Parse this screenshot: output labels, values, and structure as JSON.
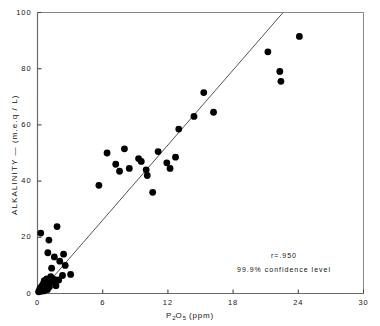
{
  "chart_data": {
    "type": "scatter",
    "title": "",
    "xlabel": "P2O5 (ppm)",
    "xlabel_parts": {
      "pre": "P",
      "sub1": "2",
      "mid": "O",
      "sub2": "5",
      "post": " (ppm)"
    },
    "ylabel": "ALKALINITY — (m.e.q / L)",
    "xlim": [
      0,
      30
    ],
    "ylim": [
      0,
      100
    ],
    "xticks": [
      0,
      6,
      12,
      18,
      24,
      30
    ],
    "xticklabels": [
      "0",
      "6",
      "12",
      "18",
      "24",
      "30"
    ],
    "yticks": [
      0,
      20,
      40,
      60,
      80,
      100
    ],
    "yticklabels": [
      "0",
      "20",
      "40",
      "60",
      "80",
      "100"
    ],
    "grid": false,
    "legend": "none",
    "marker": "filled-circle",
    "marker_color": "#000000",
    "line_color": "#555555",
    "frame_color": "#888888",
    "annotations": [
      {
        "name": "correlation",
        "text": "r=.950"
      },
      {
        "name": "confidence",
        "text": "99.9% confidence level"
      }
    ],
    "fit_line": {
      "name": "regression-line",
      "x": [
        0.35,
        22.6
      ],
      "y": [
        1.0,
        100.0
      ]
    },
    "points": [
      {
        "x": 0.1,
        "y": 0.6
      },
      {
        "x": 0.18,
        "y": 1.2
      },
      {
        "x": 0.25,
        "y": 2.0
      },
      {
        "x": 0.32,
        "y": 0.8
      },
      {
        "x": 0.4,
        "y": 2.6
      },
      {
        "x": 0.45,
        "y": 1.6
      },
      {
        "x": 0.52,
        "y": 3.4
      },
      {
        "x": 0.58,
        "y": 0.9
      },
      {
        "x": 0.62,
        "y": 4.6
      },
      {
        "x": 0.7,
        "y": 2.2
      },
      {
        "x": 0.78,
        "y": 3.0
      },
      {
        "x": 0.85,
        "y": 5.2
      },
      {
        "x": 0.92,
        "y": 1.4
      },
      {
        "x": 1.0,
        "y": 3.8
      },
      {
        "x": 1.1,
        "y": 2.4
      },
      {
        "x": 1.22,
        "y": 6.0
      },
      {
        "x": 1.35,
        "y": 4.2
      },
      {
        "x": 1.55,
        "y": 5.0
      },
      {
        "x": 1.7,
        "y": 2.8
      },
      {
        "x": 1.95,
        "y": 4.8
      },
      {
        "x": 2.3,
        "y": 6.4
      },
      {
        "x": 0.3,
        "y": 21.5
      },
      {
        "x": 1.05,
        "y": 19.0
      },
      {
        "x": 1.8,
        "y": 23.8
      },
      {
        "x": 0.95,
        "y": 14.5
      },
      {
        "x": 1.55,
        "y": 13.0
      },
      {
        "x": 1.3,
        "y": 9.0
      },
      {
        "x": 2.05,
        "y": 11.5
      },
      {
        "x": 2.55,
        "y": 10.0
      },
      {
        "x": 2.4,
        "y": 14.0
      },
      {
        "x": 3.05,
        "y": 6.8
      },
      {
        "x": 5.65,
        "y": 38.5
      },
      {
        "x": 6.4,
        "y": 50.0
      },
      {
        "x": 7.2,
        "y": 46.0
      },
      {
        "x": 7.55,
        "y": 43.5
      },
      {
        "x": 8.0,
        "y": 51.5
      },
      {
        "x": 8.45,
        "y": 44.5
      },
      {
        "x": 9.3,
        "y": 48.0
      },
      {
        "x": 9.55,
        "y": 47.0
      },
      {
        "x": 10.0,
        "y": 44.0
      },
      {
        "x": 10.1,
        "y": 42.0
      },
      {
        "x": 10.6,
        "y": 36.0
      },
      {
        "x": 11.1,
        "y": 50.5
      },
      {
        "x": 11.9,
        "y": 46.5
      },
      {
        "x": 12.2,
        "y": 44.5
      },
      {
        "x": 12.7,
        "y": 48.5
      },
      {
        "x": 13.0,
        "y": 58.5
      },
      {
        "x": 14.4,
        "y": 63.0
      },
      {
        "x": 15.3,
        "y": 71.5
      },
      {
        "x": 16.2,
        "y": 64.5
      },
      {
        "x": 21.2,
        "y": 86.0
      },
      {
        "x": 22.3,
        "y": 79.0
      },
      {
        "x": 22.4,
        "y": 75.5
      },
      {
        "x": 24.1,
        "y": 91.5
      }
    ]
  }
}
